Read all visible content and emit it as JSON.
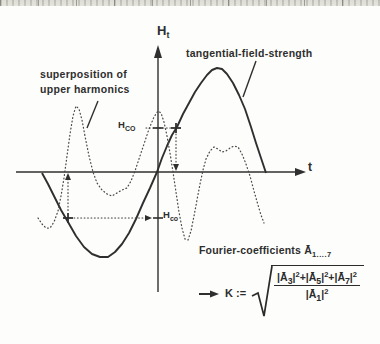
{
  "figure": {
    "y_axis": {
      "label_main": "H",
      "label_sub": "t"
    },
    "x_axis": {
      "label": "t"
    },
    "labels": {
      "solid_curve": "tangential-field-strength",
      "dotted_curve_line1": "superposition of",
      "dotted_curve_line2": "upper harmonics"
    },
    "levels": {
      "upper": {
        "main": "H",
        "sub": "CO"
      },
      "lower": {
        "main": "H",
        "sub": "co"
      }
    },
    "fourier": {
      "prefix": "Fourier-coefficients",
      "symbol": "Ā",
      "subscript": "1....7"
    },
    "formula": {
      "lhs": "K :=",
      "plus": "+",
      "terms": [
        {
          "open": "|Ā",
          "sub": "3",
          "close": "|",
          "sup": "2"
        },
        {
          "open": "|Ā",
          "sub": "5",
          "close": "|",
          "sup": "2"
        },
        {
          "open": "|Ā",
          "sub": "7",
          "close": "|",
          "sup": "2"
        }
      ],
      "denominator": {
        "open": "|Ā",
        "sub": "1",
        "close": "|",
        "sup": "2"
      }
    },
    "icons": {
      "axis_arrowheads": "filled-arrowhead",
      "formula_arrow": "right-arrow",
      "guide_markers": "plus-cross"
    },
    "colors": {
      "ink": "#2f2f2f",
      "paper": "#fdfdfb",
      "scan_band": "#dcdcd6"
    },
    "curves": {
      "solid": [
        [
          42,
          173
        ],
        [
          48,
          184
        ],
        [
          54,
          196
        ],
        [
          61,
          210
        ],
        [
          68,
          222
        ],
        [
          76,
          236
        ],
        [
          84,
          247
        ],
        [
          92,
          254
        ],
        [
          100,
          257
        ],
        [
          108,
          257
        ],
        [
          115,
          252
        ],
        [
          122,
          244
        ],
        [
          129,
          233
        ],
        [
          136,
          219
        ],
        [
          143,
          203
        ],
        [
          150,
          188
        ],
        [
          157,
          172
        ],
        [
          162,
          158
        ],
        [
          167,
          146
        ],
        [
          172,
          135
        ],
        [
          177,
          127
        ],
        [
          183,
          114
        ],
        [
          189,
          103
        ],
        [
          195,
          92
        ],
        [
          201,
          83
        ],
        [
          207,
          75
        ],
        [
          212,
          70
        ],
        [
          217,
          68
        ],
        [
          222,
          69
        ],
        [
          227,
          74
        ],
        [
          233,
          83
        ],
        [
          239,
          95
        ],
        [
          245,
          109
        ],
        [
          251,
          127
        ],
        [
          256,
          143
        ],
        [
          261,
          158
        ],
        [
          266,
          173
        ]
      ],
      "dotted": [
        [
          38,
          218
        ],
        [
          42,
          224
        ],
        [
          46,
          228
        ],
        [
          50,
          228
        ],
        [
          54,
          222
        ],
        [
          58,
          211
        ],
        [
          61,
          196
        ],
        [
          64,
          178
        ],
        [
          67,
          156
        ],
        [
          70,
          134
        ],
        [
          73,
          116
        ],
        [
          76,
          106
        ],
        [
          79,
          109
        ],
        [
          82,
          120
        ],
        [
          85,
          136
        ],
        [
          89,
          156
        ],
        [
          93,
          172
        ],
        [
          97,
          183
        ],
        [
          102,
          190
        ],
        [
          107,
          194
        ],
        [
          112,
          196
        ],
        [
          117,
          193
        ],
        [
          122,
          190
        ],
        [
          127,
          188
        ],
        [
          131,
          181
        ],
        [
          135,
          171
        ],
        [
          139,
          159
        ],
        [
          144,
          144
        ],
        [
          149,
          129
        ],
        [
          154,
          117
        ],
        [
          158,
          111
        ],
        [
          161,
          113
        ],
        [
          164,
          122
        ],
        [
          167,
          136
        ],
        [
          170,
          153
        ],
        [
          173,
          172
        ],
        [
          176,
          192
        ],
        [
          179,
          212
        ],
        [
          182,
          228
        ],
        [
          185,
          239
        ],
        [
          188,
          240
        ],
        [
          191,
          231
        ],
        [
          194,
          216
        ],
        [
          197,
          200
        ],
        [
          200,
          184
        ],
        [
          203,
          170
        ],
        [
          206,
          159
        ],
        [
          210,
          151
        ],
        [
          214,
          147
        ],
        [
          218,
          149
        ],
        [
          222,
          152
        ],
        [
          226,
          151
        ],
        [
          230,
          148
        ],
        [
          234,
          146
        ],
        [
          238,
          147
        ],
        [
          242,
          154
        ],
        [
          246,
          164
        ],
        [
          250,
          176
        ],
        [
          254,
          191
        ],
        [
          258,
          205
        ],
        [
          261,
          215
        ],
        [
          264,
          223
        ]
      ]
    }
  }
}
